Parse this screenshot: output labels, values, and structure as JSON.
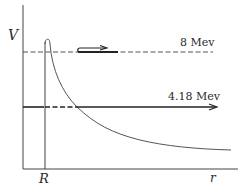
{
  "figure": {
    "type": "potential-energy-diagram",
    "axes": {
      "y_label": "V",
      "x_label": "r",
      "x_marker": "R"
    },
    "levels": [
      {
        "label": "8 Mev",
        "style": "dashed-with-bold-segment-and-hook-arrow"
      },
      {
        "label": "4.18 Mev",
        "style": "solid-dashed-solid-with-arrow"
      }
    ],
    "curve": "coulomb barrier with nuclear well edge at R",
    "colors": {
      "ink": "#2a2a2a",
      "curve": "#555555",
      "background": "#ffffff"
    }
  }
}
